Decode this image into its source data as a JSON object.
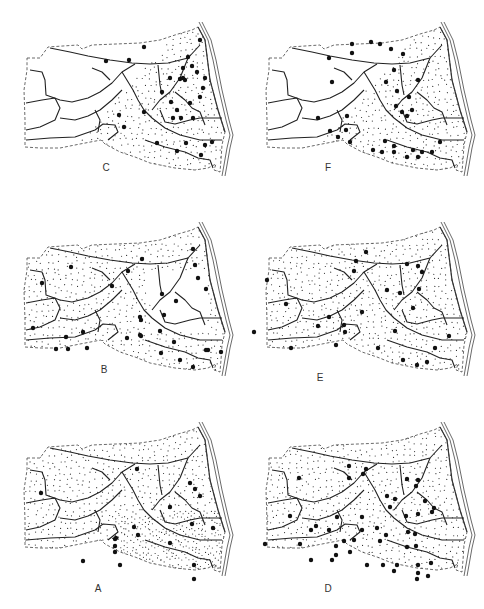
{
  "figure": {
    "panels": [
      {
        "id": "C",
        "label": "C",
        "x": 0,
        "y": 0,
        "label_x": 106,
        "label_y": 168,
        "stipple": "east",
        "dots": [
          [
            200,
            40
          ],
          [
            144,
            47
          ],
          [
            129,
            60
          ],
          [
            106,
            61
          ],
          [
            188,
            57
          ],
          [
            183,
            68
          ],
          [
            192,
            66
          ],
          [
            183,
            78
          ],
          [
            197,
            72
          ],
          [
            170,
            78
          ],
          [
            180,
            79
          ],
          [
            185,
            80
          ],
          [
            205,
            78
          ],
          [
            162,
            92
          ],
          [
            171,
            102
          ],
          [
            190,
            103
          ],
          [
            177,
            110
          ],
          [
            203,
            88
          ],
          [
            200,
            97
          ],
          [
            193,
            118
          ],
          [
            173,
            118
          ],
          [
            181,
            118
          ],
          [
            119,
            115
          ],
          [
            124,
            127
          ],
          [
            144,
            112
          ],
          [
            157,
            143
          ],
          [
            186,
            143
          ],
          [
            177,
            151
          ],
          [
            205,
            145
          ],
          [
            212,
            142
          ],
          [
            201,
            155
          ]
        ]
      },
      {
        "id": "F",
        "label": "F",
        "x": 242,
        "y": 0,
        "label_x": 86,
        "label_y": 168,
        "stipple": "east",
        "dots": [
          [
            87,
            58
          ],
          [
            110,
            44
          ],
          [
            110,
            53
          ],
          [
            129,
            42
          ],
          [
            138,
            44
          ],
          [
            149,
            49
          ],
          [
            161,
            54
          ],
          [
            152,
            70
          ],
          [
            144,
            82
          ],
          [
            176,
            80
          ],
          [
            155,
            91
          ],
          [
            167,
            97
          ],
          [
            90,
            82
          ],
          [
            154,
            106
          ],
          [
            160,
            112
          ],
          [
            170,
            110
          ],
          [
            165,
            116
          ],
          [
            76,
            118
          ],
          [
            105,
            116
          ],
          [
            88,
            131
          ],
          [
            96,
            137
          ],
          [
            104,
            130
          ],
          [
            108,
            142
          ],
          [
            143,
            141
          ],
          [
            152,
            146
          ],
          [
            131,
            150
          ],
          [
            140,
            152
          ],
          [
            152,
            152
          ],
          [
            171,
            150
          ],
          [
            180,
            152
          ],
          [
            190,
            152
          ],
          [
            165,
            157
          ],
          [
            176,
            157
          ],
          [
            198,
            142
          ]
        ]
      },
      {
        "id": "B",
        "label": "B",
        "x": 0,
        "y": 200,
        "label_x": 104,
        "label_y": 170,
        "stipple": "west",
        "dots": [
          [
            193,
            49
          ],
          [
            195,
            65
          ],
          [
            198,
            78
          ],
          [
            206,
            89
          ],
          [
            71,
            67
          ],
          [
            42,
            83
          ],
          [
            142,
            59
          ],
          [
            112,
            86
          ],
          [
            128,
            71
          ],
          [
            176,
            101
          ],
          [
            162,
            94
          ],
          [
            33,
            128
          ],
          [
            66,
            137
          ],
          [
            83,
            132
          ],
          [
            164,
            115
          ],
          [
            141,
            120
          ],
          [
            127,
            138
          ],
          [
            140,
            135
          ],
          [
            56,
            149
          ],
          [
            68,
            149
          ],
          [
            87,
            148
          ],
          [
            141,
            136
          ],
          [
            160,
            131
          ],
          [
            140,
            117
          ],
          [
            208,
            150
          ],
          [
            221,
            152
          ],
          [
            161,
            153
          ],
          [
            180,
            160
          ],
          [
            193,
            167
          ],
          [
            174,
            142
          ],
          [
            206,
            150
          ]
        ]
      },
      {
        "id": "E",
        "label": "E",
        "x": 242,
        "y": 200,
        "label_x": 78,
        "label_y": 178,
        "stipple": "all",
        "dots": [
          [
            124,
            52
          ],
          [
            114,
            61
          ],
          [
            112,
            71
          ],
          [
            165,
            64
          ],
          [
            176,
            66
          ],
          [
            180,
            72
          ],
          [
            25,
            80
          ],
          [
            44,
            104
          ],
          [
            145,
            90
          ],
          [
            158,
            93
          ],
          [
            177,
            89
          ],
          [
            171,
            108
          ],
          [
            87,
            117
          ],
          [
            120,
            112
          ],
          [
            76,
            126
          ],
          [
            102,
            125
          ],
          [
            103,
            132
          ],
          [
            12,
            132
          ],
          [
            49,
            148
          ],
          [
            94,
            145
          ],
          [
            153,
            131
          ],
          [
            207,
            136
          ],
          [
            193,
            148
          ],
          [
            136,
            148
          ],
          [
            161,
            160
          ],
          [
            175,
            165
          ],
          [
            185,
            162
          ]
        ]
      },
      {
        "id": "A",
        "label": "A",
        "x": 0,
        "y": 400,
        "label_x": 98,
        "label_y": 189,
        "stipple": "all-dense-east",
        "dots": [
          [
            137,
            69
          ],
          [
            190,
            83
          ],
          [
            195,
            89
          ],
          [
            200,
            96
          ],
          [
            41,
            93
          ],
          [
            170,
            107
          ],
          [
            134,
            127
          ],
          [
            192,
            124
          ],
          [
            213,
            128
          ],
          [
            138,
            135
          ],
          [
            116,
            138
          ],
          [
            170,
            143
          ],
          [
            115,
            139
          ],
          [
            115,
            146
          ],
          [
            115,
            152
          ],
          [
            83,
            161
          ],
          [
            120,
            165
          ],
          [
            194,
            165
          ],
          [
            194,
            179
          ]
        ]
      },
      {
        "id": "D",
        "label": "D",
        "x": 242,
        "y": 400,
        "label_x": 86,
        "label_y": 189,
        "stipple": "all",
        "dots": [
          [
            107,
            66
          ],
          [
            124,
            69
          ],
          [
            121,
            74
          ],
          [
            57,
            78
          ],
          [
            107,
            78
          ],
          [
            165,
            79
          ],
          [
            176,
            80
          ],
          [
            174,
            86
          ],
          [
            145,
            96
          ],
          [
            153,
            99
          ],
          [
            148,
            107
          ],
          [
            183,
            101
          ],
          [
            192,
            108
          ],
          [
            176,
            114
          ],
          [
            164,
            116
          ],
          [
            190,
            112
          ],
          [
            48,
            116
          ],
          [
            120,
            117
          ],
          [
            95,
            117
          ],
          [
            74,
            126
          ],
          [
            69,
            130
          ],
          [
            87,
            130
          ],
          [
            120,
            130
          ],
          [
            135,
            128
          ],
          [
            144,
            135
          ],
          [
            173,
            134
          ],
          [
            166,
            132
          ],
          [
            165,
            147
          ],
          [
            174,
            146
          ],
          [
            23,
            144
          ],
          [
            58,
            144
          ],
          [
            102,
            141
          ],
          [
            112,
            140
          ],
          [
            94,
            146
          ],
          [
            94,
            155
          ],
          [
            108,
            152
          ],
          [
            138,
            141
          ],
          [
            90,
            160
          ],
          [
            69,
            160
          ],
          [
            125,
            165
          ],
          [
            141,
            165
          ],
          [
            155,
            165
          ],
          [
            152,
            171
          ],
          [
            176,
            165
          ],
          [
            189,
            163
          ],
          [
            176,
            173
          ],
          [
            175,
            179
          ],
          [
            186,
            176
          ]
        ]
      }
    ]
  }
}
